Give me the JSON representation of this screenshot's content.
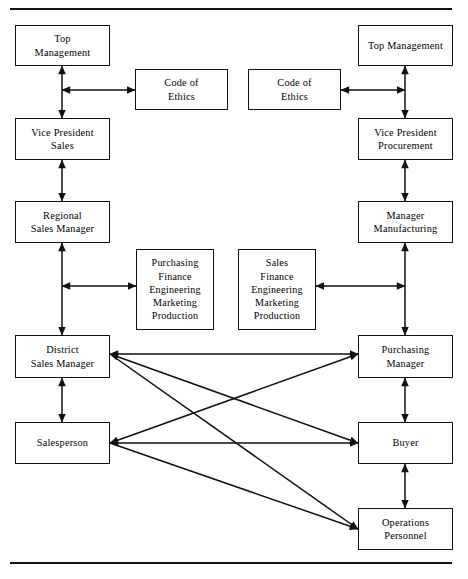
{
  "diagram": {
    "rules": [
      {
        "name": "top-rule",
        "y": 9
      },
      {
        "name": "bottom-rule",
        "y": 563
      }
    ],
    "nodes": [
      {
        "id": "top-management-left",
        "name": "top-management-seller",
        "label": "Top\nManagement",
        "x": 15,
        "y": 25,
        "w": 95,
        "h": 41
      },
      {
        "id": "code-of-ethics-left",
        "name": "code-of-ethics-seller",
        "label": "Code of\nEthics",
        "x": 135,
        "y": 69,
        "w": 93,
        "h": 41
      },
      {
        "id": "code-of-ethics-right",
        "name": "code-of-ethics-buyer",
        "label": "Code of\nEthics",
        "x": 248,
        "y": 69,
        "w": 93,
        "h": 41
      },
      {
        "id": "top-management-right",
        "name": "top-management-buyer",
        "label": "Top Management",
        "x": 358,
        "y": 25,
        "w": 95,
        "h": 41
      },
      {
        "id": "vice-president-sales",
        "name": "vice-president-sales",
        "label": "Vice President\nSales",
        "x": 15,
        "y": 118,
        "w": 95,
        "h": 42
      },
      {
        "id": "vice-president-procurement",
        "name": "vice-president-procurement",
        "label": "Vice President\nProcurement",
        "x": 358,
        "y": 118,
        "w": 95,
        "h": 42
      },
      {
        "id": "regional-sales-manager",
        "name": "regional-sales-manager",
        "label": "Regional\nSales Manager",
        "x": 15,
        "y": 201,
        "w": 95,
        "h": 42
      },
      {
        "id": "manager-manufacturing",
        "name": "manager-manufacturing",
        "label": "Manager\nManufacturing",
        "x": 358,
        "y": 201,
        "w": 95,
        "h": 42
      },
      {
        "id": "functions-purchasing",
        "name": "buyer-functional-areas",
        "label": "Purchasing\nFinance\nEngineering\nMarketing\nProduction",
        "x": 136,
        "y": 249,
        "w": 78,
        "h": 81,
        "list": true
      },
      {
        "id": "functions-sales",
        "name": "seller-functional-areas",
        "label": "Sales\nFinance\nEngineering\nMarketing\nProduction",
        "x": 238,
        "y": 249,
        "w": 78,
        "h": 81,
        "list": true
      },
      {
        "id": "district-sales-manager",
        "name": "district-sales-manager",
        "label": "District\nSales Manager",
        "x": 15,
        "y": 335,
        "w": 95,
        "h": 43
      },
      {
        "id": "purchasing-manager",
        "name": "purchasing-manager",
        "label": "Purchasing\nManager",
        "x": 358,
        "y": 335,
        "w": 95,
        "h": 43
      },
      {
        "id": "salesperson",
        "name": "salesperson",
        "label": "Salesperson",
        "x": 15,
        "y": 422,
        "w": 95,
        "h": 42
      },
      {
        "id": "buyer",
        "name": "buyer",
        "label": "Buyer",
        "x": 358,
        "y": 422,
        "w": 95,
        "h": 42
      },
      {
        "id": "operations-personnel",
        "name": "operations-personnel",
        "label": "Operations\nPersonnel",
        "x": 358,
        "y": 508,
        "w": 95,
        "h": 42
      }
    ],
    "connectors": [
      {
        "name": "top-mgmt-to-vp-sales",
        "kind": "vertical-double",
        "x": 62,
        "y1": 66,
        "y2": 118
      },
      {
        "name": "top-mgmt-to-code-ethics-seller",
        "kind": "horizontal-double",
        "y": 90,
        "x1": 62,
        "x2": 135
      },
      {
        "name": "top-mgmt-to-vp-procurement",
        "kind": "vertical-double",
        "x": 405,
        "y1": 66,
        "y2": 118
      },
      {
        "name": "code-ethics-buyer-to-top-mgmt",
        "kind": "horizontal-double",
        "y": 90,
        "x1": 341,
        "x2": 405
      },
      {
        "name": "vp-sales-to-regional-sales-manager",
        "kind": "vertical-double",
        "x": 62,
        "y1": 160,
        "y2": 201
      },
      {
        "name": "vp-procurement-to-manager-manufacturing",
        "kind": "vertical-double",
        "x": 405,
        "y1": 160,
        "y2": 201
      },
      {
        "name": "regional-to-district-sales-manager",
        "kind": "vertical-double",
        "x": 62,
        "y1": 243,
        "y2": 335
      },
      {
        "name": "manager-mfg-to-purchasing-manager",
        "kind": "vertical-double",
        "x": 405,
        "y1": 243,
        "y2": 335
      },
      {
        "name": "seller-chain-to-buyer-functions",
        "kind": "horizontal-double",
        "y": 286,
        "x1": 62,
        "x2": 136
      },
      {
        "name": "buyer-chain-to-seller-functions",
        "kind": "horizontal-double",
        "y": 286,
        "x1": 405,
        "x2": 316
      },
      {
        "name": "district-sales-manager-to-purchasing-manager",
        "kind": "horizontal-double",
        "y": 354,
        "x1": 110,
        "x2": 358
      },
      {
        "name": "district-sales-manager-to-salesperson",
        "kind": "vertical-double",
        "x": 62,
        "y1": 378,
        "y2": 422
      },
      {
        "name": "purchasing-manager-to-buyer",
        "kind": "vertical-double",
        "x": 405,
        "y1": 378,
        "y2": 422
      },
      {
        "name": "salesperson-to-buyer",
        "kind": "horizontal-double",
        "y": 443,
        "x1": 110,
        "x2": 358
      },
      {
        "name": "buyer-to-operations-personnel",
        "kind": "vertical-double",
        "x": 405,
        "y1": 464,
        "y2": 508
      },
      {
        "name": "district-sales-manager-to-buyer",
        "kind": "diagonal-double",
        "x1": 110,
        "y1": 354,
        "x2": 358,
        "y2": 443
      },
      {
        "name": "salesperson-to-purchasing-manager",
        "kind": "diagonal-double",
        "x1": 110,
        "y1": 443,
        "x2": 358,
        "y2": 354
      },
      {
        "name": "district-sales-manager-to-operations-personnel",
        "kind": "diagonal-single",
        "x1": 110,
        "y1": 354,
        "x2": 358,
        "y2": 529
      },
      {
        "name": "salesperson-to-operations-personnel",
        "kind": "diagonal-single",
        "x1": 110,
        "y1": 443,
        "x2": 358,
        "y2": 529
      }
    ],
    "colors": {
      "line": "#111111",
      "box_border": "#111111",
      "background": "#ffffff",
      "text": "#000000"
    }
  }
}
